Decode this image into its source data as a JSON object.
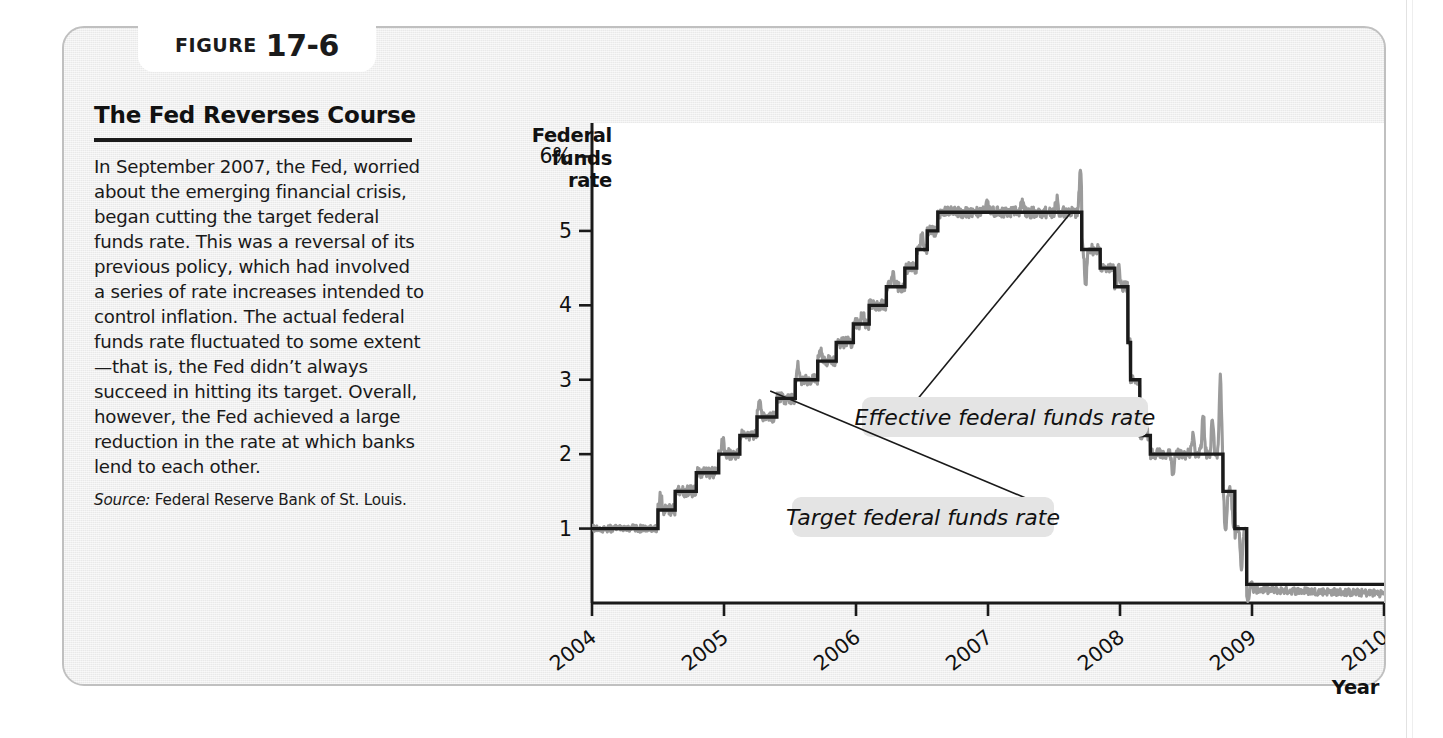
{
  "figure": {
    "label_word": "FIGURE",
    "number": "17-6",
    "title": "The Fed Reverses Course",
    "body": "In September 2007, the Fed, worried about the emerging financial crisis, began cutting the target federal funds rate. This was a reversal of its previous policy, which had involved a series of rate increases intended to control inflation. The actual federal funds rate fluctuated to some extent—that is, the Fed didn’t always succeed in hitting its target. Overall, however, the Fed achieved a large reduction in the rate at which banks lend to each other.",
    "source_label": "Source:",
    "source_text": "Federal Reserve Bank of St. Louis."
  },
  "chart_data": {
    "type": "line",
    "title": "The Fed Reverses Course",
    "xlabel": "Year",
    "ylabel": "Federal funds rate",
    "ylabel_lines": [
      "Federal",
      "funds",
      "rate"
    ],
    "xlim": [
      2004,
      2010
    ],
    "ylim": [
      0,
      6.45
    ],
    "grid": false,
    "legend_position": "inline-annotations",
    "y_ticks": [
      1,
      2,
      3,
      4,
      5,
      6
    ],
    "y_tick_labels": [
      "1",
      "2",
      "3",
      "4",
      "5",
      "6%"
    ],
    "x_ticks": [
      2004,
      2005,
      2006,
      2007,
      2008,
      2009,
      2010
    ],
    "x_tick_labels": [
      "2004",
      "2005",
      "2006",
      "2007",
      "2008",
      "2009",
      "2010"
    ],
    "annotations": [
      {
        "text": "Effective federal funds rate",
        "points_to_x": 2007.63,
        "points_to_y": 5.25
      },
      {
        "text": "Target federal funds rate",
        "points_to_x": 2005.35,
        "points_to_y": 2.85
      }
    ],
    "series": [
      {
        "name": "Target federal funds rate",
        "color": "#1a1a1a",
        "step": true,
        "points": [
          [
            2004.0,
            1.0
          ],
          [
            2004.5,
            1.0
          ],
          [
            2004.5,
            1.25
          ],
          [
            2004.63,
            1.25
          ],
          [
            2004.63,
            1.5
          ],
          [
            2004.79,
            1.5
          ],
          [
            2004.79,
            1.75
          ],
          [
            2004.96,
            1.75
          ],
          [
            2004.96,
            2.0
          ],
          [
            2005.12,
            2.0
          ],
          [
            2005.12,
            2.25
          ],
          [
            2005.25,
            2.25
          ],
          [
            2005.25,
            2.5
          ],
          [
            2005.4,
            2.5
          ],
          [
            2005.4,
            2.75
          ],
          [
            2005.54,
            2.75
          ],
          [
            2005.54,
            3.0
          ],
          [
            2005.71,
            3.0
          ],
          [
            2005.71,
            3.25
          ],
          [
            2005.85,
            3.25
          ],
          [
            2005.85,
            3.5
          ],
          [
            2005.98,
            3.5
          ],
          [
            2005.98,
            3.75
          ],
          [
            2006.1,
            3.75
          ],
          [
            2006.1,
            4.0
          ],
          [
            2006.23,
            4.0
          ],
          [
            2006.23,
            4.25
          ],
          [
            2006.37,
            4.25
          ],
          [
            2006.37,
            4.5
          ],
          [
            2006.46,
            4.5
          ],
          [
            2006.46,
            4.75
          ],
          [
            2006.54,
            4.75
          ],
          [
            2006.54,
            5.0
          ],
          [
            2006.62,
            5.0
          ],
          [
            2006.62,
            5.25
          ],
          [
            2007.71,
            5.25
          ],
          [
            2007.71,
            4.75
          ],
          [
            2007.85,
            4.75
          ],
          [
            2007.85,
            4.5
          ],
          [
            2007.96,
            4.5
          ],
          [
            2007.96,
            4.25
          ],
          [
            2008.06,
            4.25
          ],
          [
            2008.06,
            3.5
          ],
          [
            2008.08,
            3.5
          ],
          [
            2008.08,
            3.0
          ],
          [
            2008.15,
            3.0
          ],
          [
            2008.15,
            2.25
          ],
          [
            2008.23,
            2.25
          ],
          [
            2008.23,
            2.0
          ],
          [
            2008.78,
            2.0
          ],
          [
            2008.78,
            1.5
          ],
          [
            2008.87,
            1.5
          ],
          [
            2008.87,
            1.0
          ],
          [
            2008.96,
            1.0
          ],
          [
            2008.96,
            0.25
          ],
          [
            2010.0,
            0.25
          ]
        ]
      },
      {
        "name": "Effective federal funds rate",
        "color": "#9b9b9b",
        "step": false,
        "note": "Daily effective rate fluctuating around the target; noisy band with spikes in late 2007 and autumn 2008."
      }
    ]
  }
}
